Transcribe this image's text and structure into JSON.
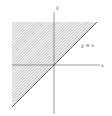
{
  "diagram": {
    "type": "region-plot",
    "axes": {
      "x_label": "x",
      "y_label": "y"
    },
    "line": {
      "label": "y = x",
      "equation": "y = x"
    },
    "shaded_region": {
      "description": "region above the line y = x",
      "pattern": "diagonal hatching"
    },
    "colors": {
      "ink": "#444444",
      "hatch": "#888888",
      "background": "#ffffff"
    }
  }
}
